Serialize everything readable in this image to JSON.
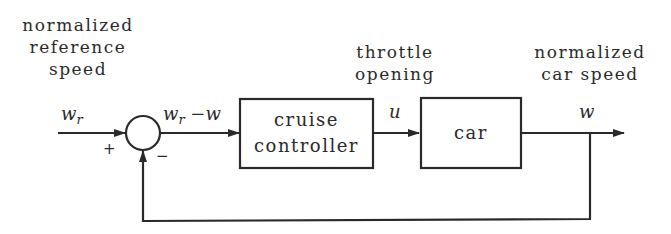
{
  "diagram": {
    "type": "feedback-block-diagram",
    "labels": {
      "reference": [
        "normalized",
        "reference",
        "speed"
      ],
      "throttle": [
        "throttle",
        "opening"
      ],
      "car_speed": [
        "normalized",
        "car speed"
      ]
    },
    "signals": {
      "input": "w",
      "input_sub": "r",
      "error_main": "w",
      "error_sub": "r",
      "error_rest": " −w",
      "control": "u",
      "output": "w"
    },
    "summing_junction": {
      "plus_sign": "+",
      "minus_sign": "−"
    },
    "blocks": {
      "controller": [
        "cruise",
        "controller"
      ],
      "plant": [
        "car"
      ]
    },
    "colors": {
      "line": "#2a2a2a",
      "background": "#ffffff"
    }
  }
}
